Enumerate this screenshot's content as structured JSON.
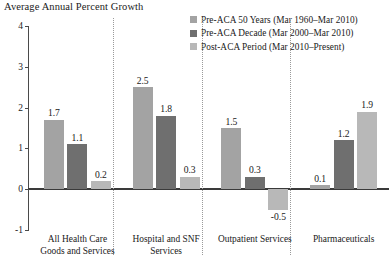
{
  "chart_data": {
    "type": "bar",
    "title": "Average Annual Percent Growth",
    "xlabel": "",
    "ylabel": "",
    "ylim": [
      -1,
      4
    ],
    "yticks": [
      "4",
      "3",
      "2",
      "1",
      "0",
      "-1"
    ],
    "grid": false,
    "legend_position": "top-right",
    "categories": [
      "All Health Care Goods and Services",
      "Hospital and SNF Services",
      "Outpatient Services",
      "Pharmaceuticals"
    ],
    "series": [
      {
        "name": "Pre-ACA 50 Years (Mar 1960–Mar 2010)",
        "color": "#a3a3a3",
        "values": [
          1.7,
          2.5,
          1.5,
          0.1
        ],
        "labels": [
          "1.7",
          "2.5",
          "1.5",
          "0.1"
        ]
      },
      {
        "name": "Pre-ACA Decade (Mar 2000–Mar 2010)",
        "color": "#6f6f6f",
        "values": [
          1.1,
          1.8,
          0.3,
          1.2
        ],
        "labels": [
          "1.1",
          "1.8",
          "0.3",
          "1.2"
        ]
      },
      {
        "name": "Post-ACA Period (Mar 2010–Present)",
        "color": "#b8b8b8",
        "values": [
          0.2,
          0.3,
          -0.5,
          1.9
        ],
        "labels": [
          "0.2",
          "0.3",
          "-0.5",
          "1.9"
        ]
      }
    ]
  },
  "legend": {
    "items": [
      {
        "label": "Pre-ACA 50 Years (Mar 1960–Mar 2010)"
      },
      {
        "label": "Pre-ACA Decade (Mar 2000–Mar 2010)"
      },
      {
        "label": "Post-ACA Period (Mar 2010–Present)"
      }
    ]
  },
  "axis": {
    "y_labels": [
      "4",
      "3",
      "2",
      "1",
      "0",
      "-1"
    ]
  },
  "category_labels": [
    "All Health Care Goods and Services",
    "Hospital and SNF Services",
    "Outpatient Services",
    "Pharmaceuticals"
  ]
}
